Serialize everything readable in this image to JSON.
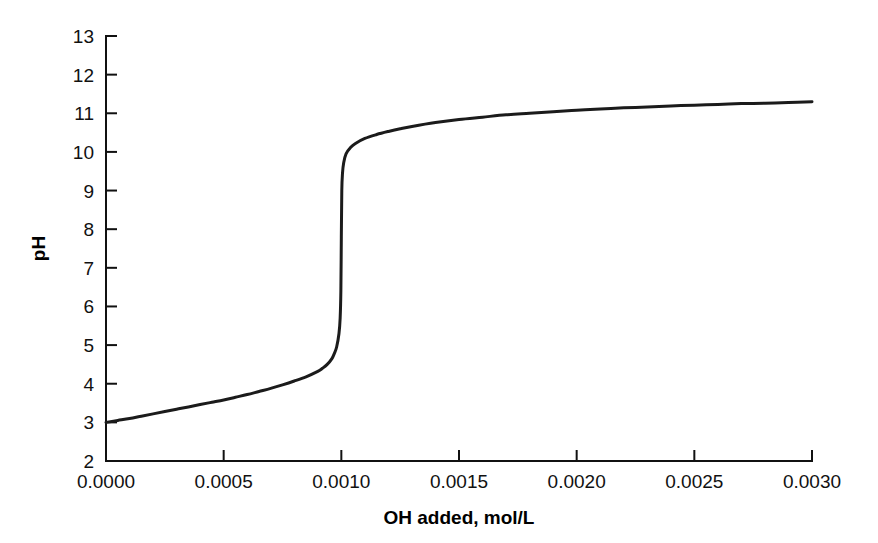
{
  "chart_data": {
    "type": "line",
    "title": "",
    "subtitle": "",
    "xlabel": "OH added, mol/L",
    "ylabel": "pH",
    "xlim": [
      0.0,
      0.003
    ],
    "ylim": [
      2,
      13
    ],
    "grid": false,
    "legend": "none",
    "xticks": [
      0.0,
      0.0005,
      0.001,
      0.0015,
      0.002,
      0.0025,
      0.003
    ],
    "xtick_labels": [
      "0.0000",
      "0.0005",
      "0.0010",
      "0.0015",
      "0.0020",
      "0.0025",
      "0.0030"
    ],
    "yticks": [
      2,
      3,
      4,
      5,
      6,
      7,
      8,
      9,
      10,
      11,
      12,
      13
    ],
    "ytick_labels": [
      "2",
      "3",
      "4",
      "5",
      "6",
      "7",
      "8",
      "9",
      "10",
      "11",
      "12",
      "13"
    ],
    "series": [
      {
        "name": "titration curve",
        "x": [
          0.0,
          5e-05,
          0.0001,
          0.00015,
          0.0002,
          0.00025,
          0.0003,
          0.00035,
          0.0004,
          0.00045,
          0.0005,
          0.00055,
          0.0006,
          0.00065,
          0.0007,
          0.00075,
          0.0008,
          0.00085,
          0.0009,
          0.00092,
          0.00094,
          0.00096,
          0.00097,
          0.00098,
          0.00099,
          0.000995,
          0.000998,
          0.001,
          0.001002,
          0.001005,
          0.00101,
          0.00102,
          0.00104,
          0.00106,
          0.0011,
          0.00115,
          0.0012,
          0.00125,
          0.0013,
          0.0014,
          0.0015,
          0.0016,
          0.0017,
          0.0018,
          0.0019,
          0.002,
          0.0021,
          0.0022,
          0.0023,
          0.0024,
          0.0025,
          0.0026,
          0.0027,
          0.0028,
          0.0029,
          0.003
        ],
        "y": [
          3.0,
          3.05,
          3.1,
          3.16,
          3.22,
          3.28,
          3.34,
          3.4,
          3.46,
          3.52,
          3.58,
          3.65,
          3.72,
          3.8,
          3.88,
          3.97,
          4.07,
          4.18,
          4.32,
          4.4,
          4.5,
          4.65,
          4.78,
          4.95,
          5.3,
          5.7,
          6.4,
          7.8,
          9.0,
          9.45,
          9.72,
          9.95,
          10.12,
          10.22,
          10.35,
          10.45,
          10.53,
          10.6,
          10.66,
          10.76,
          10.84,
          10.9,
          10.96,
          11.0,
          11.04,
          11.08,
          11.11,
          11.14,
          11.16,
          11.19,
          11.21,
          11.23,
          11.25,
          11.26,
          11.28,
          11.3
        ]
      }
    ],
    "annotations": [],
    "colors": {
      "curve": "#1b1b1b",
      "axis": "#111111",
      "background": "#ffffff"
    }
  }
}
